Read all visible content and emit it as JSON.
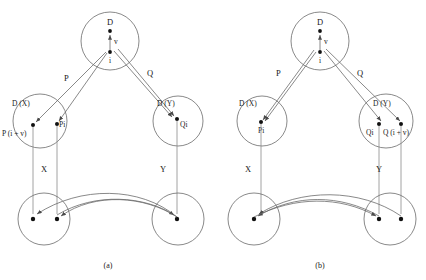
{
  "figure": {
    "caption_a": "(a)",
    "caption_b": "(b)"
  },
  "panel_a": {
    "top_cluster_label": "D",
    "top_edge_label": "v",
    "top_lower_node_label": "i",
    "left_edge_label": "P",
    "right_edge_label": "Q",
    "left_cluster_label": "D (X)",
    "right_cluster_label": "D (Y)",
    "left_node_1_label": "P (i + v)",
    "left_node_2_label": "Pi",
    "right_node_1_label": "Qi",
    "lower_left_label": "X",
    "lower_right_label": "Y"
  },
  "panel_b": {
    "top_cluster_label": "D",
    "top_edge_label": "v",
    "top_lower_node_label": "i",
    "left_edge_label": "P",
    "right_edge_label": "Q",
    "left_cluster_label": "D (X)",
    "right_cluster_label": "D (Y)",
    "left_node_1_label": "Pi",
    "right_node_1_label": "Qi",
    "right_node_2_label": "Q (i + v)",
    "lower_left_label": "X",
    "lower_right_label": "Y"
  },
  "colors": {
    "circle_stroke": "#6b6b6b",
    "node_fill": "#111111",
    "edge_stroke": "#6b6b6b",
    "vline_stroke": "#8a8a8a",
    "text": "#1a1a1a",
    "background": "#ffffff"
  }
}
